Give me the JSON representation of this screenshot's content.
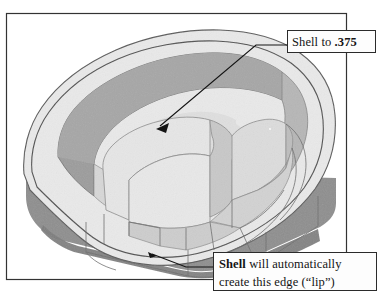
{
  "figure": {
    "kind": "cad-isometric-illustration",
    "frame": {
      "border_color": "#333333",
      "background": "#ffffff"
    },
    "colors": {
      "outline": "#4a4a4a",
      "top_rim_light": "#e9e9e9",
      "top_rim_mid": "#dedede",
      "floor_light": "#ececec",
      "inner_wall_dark": "#9c9c9c",
      "inner_wall_mid": "#b4b4b4",
      "boss_face_light": "#e4e4e4",
      "boss_face_mid": "#cfcfcf",
      "side_wall_dark": "#8f8f8f",
      "lip_shadow": "#7e7e7e",
      "hidden_line": "#6f6f6f",
      "leader_line": "#1a1a1a"
    }
  },
  "callouts": [
    {
      "id": "shell-thickness",
      "lines": [
        {
          "plain_before": "Shell to ",
          "bold": ".375",
          "plain_after": ""
        }
      ],
      "text": "Shell to .375",
      "leader": {
        "type": "elbow-with-arrow",
        "from": "callout-left-edge",
        "to_target": "inner pocket floor",
        "arrow_head": true
      }
    },
    {
      "id": "lip-edge",
      "lines": [
        {
          "plain_before": "",
          "bold": "Shell",
          "plain_after": " will automatically"
        },
        {
          "plain_before": "create this edge (“lip”)",
          "bold": "",
          "plain_after": ""
        }
      ],
      "text": "Shell will automatically create this edge (“lip”)",
      "leader": {
        "type": "elbow-with-arrow",
        "from": "callout-left-edge",
        "to_target": "bottom outer lip edge",
        "arrow_head": true
      }
    }
  ]
}
